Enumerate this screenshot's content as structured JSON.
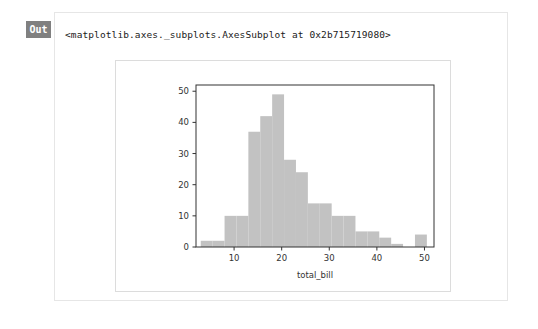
{
  "cell": {
    "prompt_label": "Out",
    "output_repr": "<matplotlib.axes._subplots.AxesSubplot at 0x2b715719080>"
  },
  "colors": {
    "bar_fill": "#c2c2c2",
    "axis": "#333333",
    "badge_bg": "#808080",
    "badge_text": "#ffffff",
    "card_border": "#e6e6e6",
    "figure_border": "#dcdcdc",
    "text": "#1a1a1a"
  },
  "chart_data": {
    "type": "bar",
    "title": "",
    "subtitle": "",
    "xlabel": "total_bill",
    "ylabel": "",
    "xlim": [
      2.0,
      52.0
    ],
    "ylim": [
      0,
      52
    ],
    "grid": false,
    "legend": null,
    "bin_width": 2.5,
    "bin_edges": [
      3.0,
      5.5,
      8.0,
      10.5,
      13.0,
      15.5,
      18.0,
      20.5,
      23.0,
      25.5,
      28.0,
      30.5,
      33.0,
      35.5,
      38.0,
      40.5,
      43.0,
      45.5,
      48.0,
      50.5
    ],
    "categories": [
      "3.0-5.5",
      "5.5-8.0",
      "8.0-10.5",
      "10.5-13.0",
      "13.0-15.5",
      "15.5-18.0",
      "18.0-20.5",
      "20.5-23.0",
      "23.0-25.5",
      "25.5-28.0",
      "28.0-30.5",
      "30.5-33.0",
      "33.0-35.5",
      "35.5-38.0",
      "38.0-40.5",
      "40.5-43.0",
      "43.0-45.5",
      "45.5-48.0",
      "48.0-50.5"
    ],
    "values": [
      2,
      2,
      10,
      10,
      37,
      42,
      49,
      28,
      24,
      14,
      14,
      10,
      10,
      5,
      5,
      3,
      1,
      0,
      4
    ],
    "xticks": [
      10,
      20,
      30,
      40,
      50
    ],
    "xtick_labels": [
      "10",
      "20",
      "30",
      "40",
      "50"
    ],
    "yticks": [
      0,
      10,
      20,
      30,
      40,
      50
    ],
    "ytick_labels": [
      "0",
      "10",
      "20",
      "30",
      "40",
      "50"
    ]
  }
}
